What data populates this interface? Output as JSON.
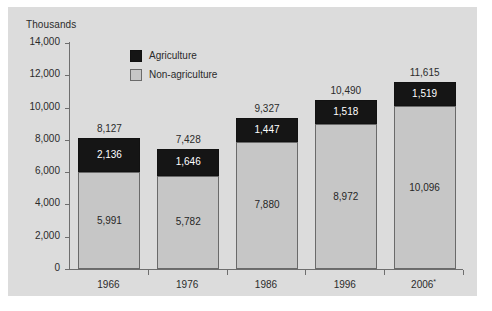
{
  "units_caption": "Thousands",
  "legend": {
    "position": "inside-top-left",
    "items": [
      {
        "label": "Agriculture",
        "color": "#151515",
        "swatch": "agriculture-swatch"
      },
      {
        "label": "Non-agriculture",
        "color": "#c6c6c6",
        "swatch": "non-agriculture-swatch"
      }
    ]
  },
  "axes": {
    "y_ticks": [
      "14,000",
      "12,000",
      "10,000",
      "8,000",
      "6,000",
      "4,000",
      "2,000",
      "0"
    ],
    "y_tick_values": [
      14000,
      12000,
      10000,
      8000,
      6000,
      4000,
      2000,
      0
    ],
    "x_categories": [
      "1966",
      "1976",
      "1986",
      "1996",
      "2006"
    ],
    "x_category_display": [
      "1966",
      "1976",
      "1986",
      "1996",
      "2006*"
    ],
    "last_category_footnote": "*"
  },
  "chart_data": {
    "type": "bar",
    "subtype": "stacked-column",
    "title": "",
    "subtitle": "",
    "xlabel": "",
    "ylabel": "Thousands",
    "ylim": [
      0,
      14000
    ],
    "ytick_step": 2000,
    "grid": false,
    "legend_position": "inside-top-left",
    "categories": [
      "1966",
      "1976",
      "1986",
      "1996",
      "2006*"
    ],
    "series": [
      {
        "name": "Non-agriculture",
        "color": "#c6c6c6",
        "values": [
          5991,
          5782,
          7880,
          8972,
          10096
        ],
        "value_labels": [
          "5,991",
          "5,782",
          "7,880",
          "8,972",
          "10,096"
        ]
      },
      {
        "name": "Agriculture",
        "color": "#151515",
        "values": [
          2136,
          1646,
          1447,
          1518,
          1519
        ],
        "value_labels": [
          "2,136",
          "1,646",
          "1,447",
          "1,518",
          "1,519"
        ]
      }
    ],
    "totals": [
      8127,
      7428,
      9327,
      10490,
      11615
    ],
    "total_labels": [
      "8,127",
      "7,428",
      "9,327",
      "10,490",
      "11,615"
    ]
  },
  "colors": {
    "page_background": "#ffffff",
    "panel_background": "#dcdcdc",
    "agriculture": "#151515",
    "non_agriculture": "#c6c6c6",
    "axis_line": "#6e6e6e",
    "text": "#2b2b2b"
  }
}
